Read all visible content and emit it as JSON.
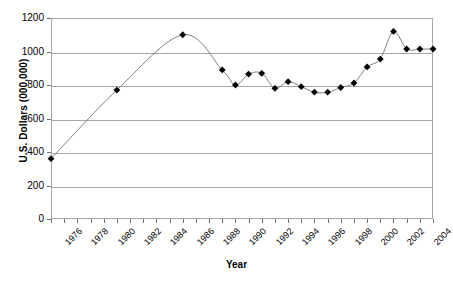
{
  "chart_data": {
    "type": "line",
    "title": "",
    "xlabel": "Year",
    "ylabel": "U.S. Dollars (000,000)",
    "ylim": [
      0,
      1200
    ],
    "ytick_values": [
      0,
      200,
      400,
      600,
      800,
      1000,
      1200
    ],
    "ytick_labels": [
      "0",
      "200",
      "400",
      "600",
      "800",
      "1000",
      "1200"
    ],
    "xlim": [
      1976,
      2005
    ],
    "xtick_values": [
      1976,
      1977,
      1978,
      1979,
      1980,
      1981,
      1982,
      1983,
      1984,
      1985,
      1986,
      1987,
      1988,
      1989,
      1990,
      1991,
      1992,
      1993,
      1994,
      1995,
      1996,
      1997,
      1998,
      1999,
      2000,
      2001,
      2002,
      2003,
      2004,
      2005
    ],
    "xtick_labels": [
      "1976",
      "",
      "1978",
      "",
      "1980",
      "",
      "1982",
      "",
      "1984",
      "",
      "1986",
      "",
      "1988",
      "",
      "1990",
      "",
      "1992",
      "",
      "1994",
      "",
      "1996",
      "",
      "1998",
      "",
      "2000",
      "",
      "2002",
      "",
      "2004",
      ""
    ],
    "grid": "horizontal",
    "legend": "none",
    "marker": "diamond",
    "marker_color": "#000000",
    "line_color": "#808080",
    "grid_color": "#a6a6a6",
    "x": [
      1976,
      1981,
      1986,
      1989,
      1990,
      1991,
      1992,
      1993,
      1994,
      1995,
      1996,
      1997,
      1998,
      1999,
      2000,
      2001,
      2002,
      2003,
      2004,
      2005
    ],
    "values": [
      360,
      770,
      1100,
      890,
      800,
      865,
      870,
      780,
      820,
      790,
      757,
      757,
      785,
      812,
      908,
      955,
      1120,
      1015,
      1015,
      1015
    ],
    "series": [
      {
        "name": "U.S. Dollars",
        "points": [
          {
            "year": 1976,
            "value": 360
          },
          {
            "year": 1981,
            "value": 770
          },
          {
            "year": 1986,
            "value": 1100
          },
          {
            "year": 1989,
            "value": 890
          },
          {
            "year": 1990,
            "value": 800
          },
          {
            "year": 1991,
            "value": 865
          },
          {
            "year": 1992,
            "value": 870
          },
          {
            "year": 1993,
            "value": 780
          },
          {
            "year": 1994,
            "value": 820
          },
          {
            "year": 1995,
            "value": 790
          },
          {
            "year": 1996,
            "value": 757
          },
          {
            "year": 1997,
            "value": 757
          },
          {
            "year": 1998,
            "value": 785
          },
          {
            "year": 1999,
            "value": 812
          },
          {
            "year": 2000,
            "value": 908
          },
          {
            "year": 2001,
            "value": 955
          },
          {
            "year": 2002,
            "value": 1120
          },
          {
            "year": 2003,
            "value": 1015
          },
          {
            "year": 2004,
            "value": 1015
          }
        ]
      }
    ]
  }
}
